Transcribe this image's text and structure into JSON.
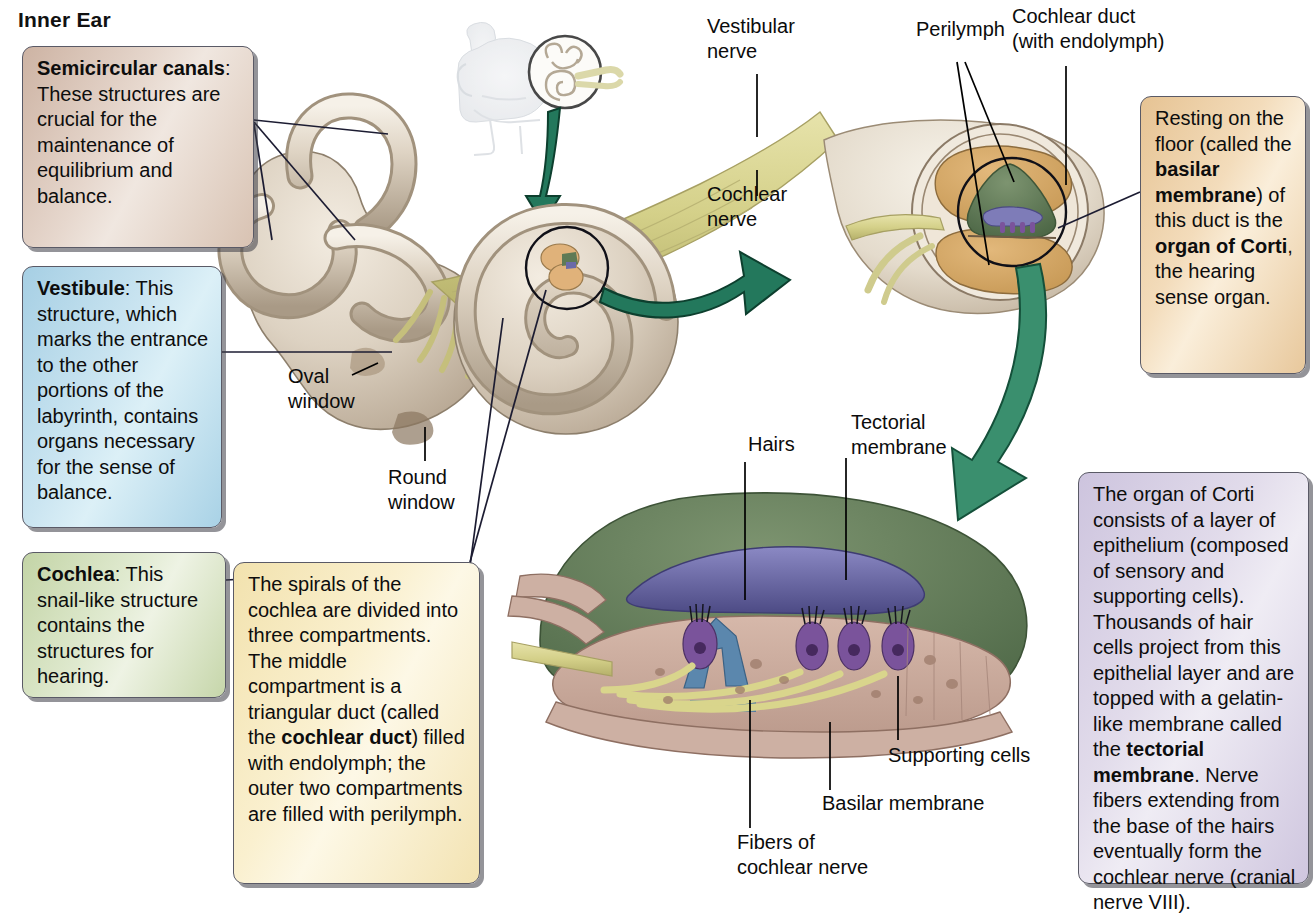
{
  "figure": {
    "title": "Inner Ear"
  },
  "callouts": {
    "semicircular": {
      "term": "Semicircular canals",
      "text": ": These structures are crucial for the maintenance of equilibrium and balance.",
      "color": "#d8c2b2"
    },
    "vestibule": {
      "term": "Vestibule",
      "text": ": This structure, which marks the entrance to the other portions of the labyrinth, contains organs necessary for the sense of balance.",
      "color": "#a9d2e6"
    },
    "cochlea": {
      "term": "Cochlea",
      "text": ": This snail-like structure contains the structures for hearing.",
      "color": "#c6d6aa"
    },
    "spirals": {
      "part1": "The spirals of the cochlea are divided into three compartments. The middle compartment is a triangular duct (called the ",
      "bold1": "cochlear duct",
      "part2": ") filled with endolymph; the outer two compartments are filled with perilymph.",
      "color": "#f3e3b2"
    },
    "resting": {
      "part1": "Resting on the floor (called the ",
      "bold1": "basilar membrane",
      "part2": ") of this duct is the ",
      "bold2": "organ of Corti",
      "part3": ", the hearing sense organ.",
      "color": "#e8c89c"
    },
    "corti": {
      "part1": "The organ of Corti consists of a layer of epithelium (composed of sensory and supporting cells). Thousands of hair cells project from this epithelial layer and are topped with a gelatin-like membrane called the ",
      "bold1": "tectorial membrane",
      "part2": ". Nerve fibers extending from the base of the hairs eventually form the cochlear nerve (cranial nerve VIII).",
      "color": "#cfc6df"
    }
  },
  "labels": {
    "vestibular_nerve": "Vestibular\nnerve",
    "cochlear_nerve": "Cochlear\nnerve",
    "perilymph": "Perilymph",
    "cochlear_duct": "Cochlear duct\n(with endolymph)",
    "oval_window": "Oval\nwindow",
    "round_window": "Round\nwindow",
    "hairs": "Hairs",
    "tectorial_membrane": "Tectorial\nmembrane",
    "supporting_cells": "Supporting cells",
    "basilar_membrane": "Basilar membrane",
    "fibers_of_cochlear_nerve": "Fibers of\ncochlear nerve"
  },
  "palette": {
    "arrow_green": "#23785c",
    "bone": "#d6cbbc",
    "nerve_yellow": "#d9d58c",
    "perilymph_tan": "#d6a866",
    "endolymph_green": "#5f7a55",
    "tectorial_purple": "#6b6aa8",
    "hair_cell_purple": "#7a539b",
    "pillar_blue": "#5b87ad",
    "supporting_pink": "#c9a99c",
    "leader_line": "#1c1c32"
  }
}
